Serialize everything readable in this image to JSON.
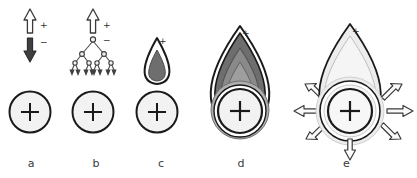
{
  "figure": {
    "background_color": "#ffffff",
    "width": 417,
    "height": 178
  },
  "colors": {
    "outline": "#1a1a1a",
    "particle_fill": "#f2f2f2",
    "dark_gray": "#6e6e6e",
    "mid_gray": "#8c8c8c",
    "light_gray": "#d9d9d9",
    "pale_gray": "#ededed",
    "very_pale_gray": "#f5f5f5",
    "white": "#ffffff",
    "label_text": "#3a3a3a",
    "sign_text": "#2b2b2b"
  },
  "panels": [
    {
      "id": "a",
      "label": "a",
      "center_x": 30,
      "description": "Charged particle with a hollow up arrow marked plus and a filled down arrow marked minus",
      "particle": {
        "cx": 30,
        "cy": 112,
        "r": 21,
        "symbol": "+"
      },
      "annotations": [
        {
          "name": "up-arrow-positive",
          "sign": "+",
          "style": "hollow",
          "direction": "up"
        },
        {
          "name": "down-arrow-negative",
          "sign": "−",
          "style": "filled",
          "direction": "down"
        }
      ]
    },
    {
      "id": "b",
      "label": "b",
      "center_x": 93,
      "description": "Charged particle with hollow up arrow marked plus and a branching electron avalanche tree marked minus",
      "particle": {
        "cx": 93,
        "cy": 112,
        "r": 21,
        "symbol": "+"
      },
      "annotations": [
        {
          "name": "up-arrow-positive",
          "sign": "+",
          "style": "hollow",
          "direction": "up"
        },
        {
          "name": "avalanche-tree-negative",
          "sign": "−",
          "style": "branching-tree",
          "levels": 3,
          "leaf_count": 8
        }
      ]
    },
    {
      "id": "c",
      "label": "c",
      "center_x": 157,
      "description": "Charged particle with a small teardrop streamer head containing a dark gray core and a plus mark at the tip",
      "particle": {
        "cx": 157,
        "cy": 112,
        "r": 21,
        "symbol": "+"
      },
      "annotations": [
        {
          "name": "streamer-teardrop-small",
          "sign": "+",
          "style": "teardrop",
          "core_shade": "dark_gray"
        }
      ]
    },
    {
      "id": "d",
      "label": "d",
      "center_x": 240,
      "description": "Charged particle enclosed in a large dark teardrop streamer with concentric gray shells and a plus mark at the tip",
      "particle": {
        "cx": 240,
        "cy": 112,
        "r": 23,
        "symbol": "+"
      },
      "annotations": [
        {
          "name": "streamer-teardrop-large",
          "sign": "+",
          "style": "teardrop",
          "core_shade": "dark_gray",
          "shells": 4
        }
      ]
    },
    {
      "id": "e",
      "label": "e",
      "center_x": 350,
      "description": "Charged particle in a pale teardrop with concentric shells and six hollow arrows radiating outward plus a downward arrow at the bottom",
      "particle": {
        "cx": 350,
        "cy": 112,
        "r": 23,
        "symbol": "+"
      },
      "annotations": [
        {
          "name": "expanding-teardrop",
          "sign": "+",
          "style": "teardrop",
          "core_shade": "pale_gray",
          "shells": 3
        },
        {
          "name": "radiating-arrows",
          "style": "hollow",
          "count": 6,
          "directions": [
            "left",
            "upper-left",
            "lower-left",
            "right",
            "upper-right",
            "lower-right"
          ]
        },
        {
          "name": "down-arrow-bottom",
          "style": "hollow",
          "direction": "down"
        }
      ]
    }
  ]
}
